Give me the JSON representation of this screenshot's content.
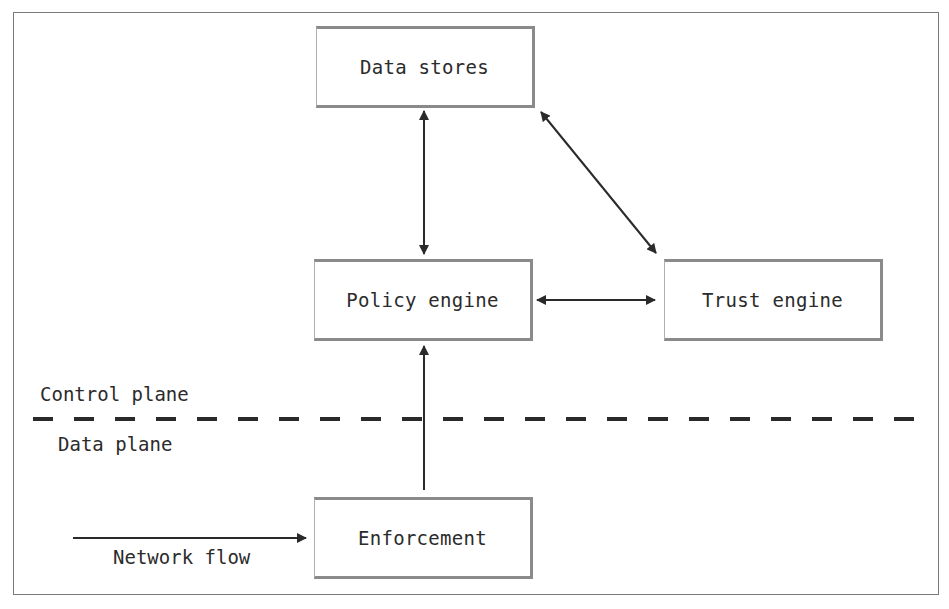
{
  "diagram": {
    "nodes": {
      "data_stores": "Data stores",
      "policy_engine": "Policy engine",
      "trust_engine": "Trust engine",
      "enforcement": "Enforcement"
    },
    "labels": {
      "control_plane": "Control plane",
      "data_plane": "Data plane",
      "network_flow": "Network flow"
    },
    "edges": [
      {
        "from": "data_stores",
        "to": "policy_engine",
        "direction": "bidirectional"
      },
      {
        "from": "data_stores",
        "to": "trust_engine",
        "direction": "bidirectional"
      },
      {
        "from": "policy_engine",
        "to": "trust_engine",
        "direction": "bidirectional"
      },
      {
        "from": "enforcement",
        "to": "policy_engine",
        "direction": "forward"
      },
      {
        "from": "external",
        "to": "enforcement",
        "direction": "forward",
        "label": "Network flow"
      }
    ],
    "boundary": {
      "style": "dashed",
      "above": "Control plane",
      "below": "Data plane"
    },
    "colors": {
      "line": "#2a2a2a",
      "box_border": "#8a8a8a",
      "frame": "#7a7a7a"
    }
  }
}
